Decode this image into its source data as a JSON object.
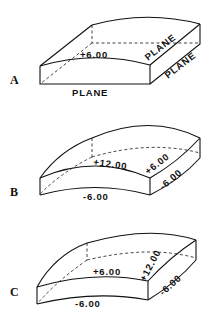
{
  "figure": {
    "panels": [
      {
        "id": "A",
        "label": "A",
        "top_label": "+6.00",
        "right_top_label": "PLANE",
        "right_side_label": "PLANE",
        "front_label": "PLANE"
      },
      {
        "id": "B",
        "label": "B",
        "top_label": "+12.00",
        "right_top_label": "+6.00",
        "right_side_label": "-6.00",
        "front_label": "-6.00"
      },
      {
        "id": "C",
        "label": "C",
        "top_label": "+6.00",
        "right_top_label": "+12.00",
        "right_side_label": "-6.00",
        "front_label": "-6.00"
      }
    ],
    "colors": {
      "line": "#111111",
      "background": "#ffffff"
    }
  }
}
